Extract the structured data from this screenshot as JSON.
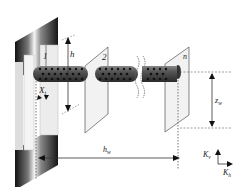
{
  "diagram": {
    "plates": [
      {
        "label": "1"
      },
      {
        "label": "2"
      },
      {
        "label": "n"
      }
    ],
    "dimensions": {
      "h": "h",
      "x": "X",
      "x_sub": "t",
      "hw": "h",
      "hw_sub": "w",
      "zw": "z",
      "zw_sub": "w"
    },
    "axes": {
      "kv": "K",
      "kv_sub": "v",
      "kh": "K",
      "kh_sub": "h"
    },
    "colors": {
      "wall_dark": "#1a1a1a",
      "wall_light": "#e8e8e8",
      "rod": "#3a3a3a",
      "holes": "#111111",
      "plate_fill": "#f2f2f2",
      "plate_stroke": "#555555",
      "dim_line": "#333333"
    }
  }
}
